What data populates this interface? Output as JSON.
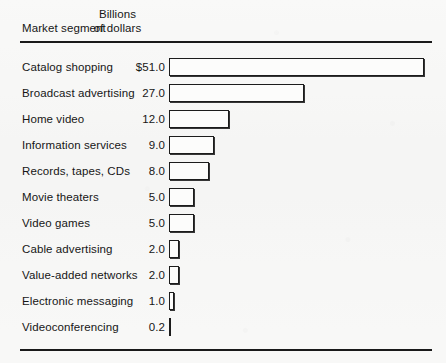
{
  "header": {
    "left_label": "Market segment",
    "right_label_line1": "Billions",
    "right_label_line2": "of dollars"
  },
  "chart_data": {
    "type": "bar",
    "orientation": "horizontal",
    "title": "",
    "xlabel": "Billions of dollars",
    "ylabel": "Market segment",
    "grid": false,
    "legend": null,
    "axis_origin": 0,
    "xlim": [
      0,
      51
    ],
    "categories": [
      "Catalog shopping",
      "Broadcast advertising",
      "Home video",
      "Information services",
      "Records, tapes, CDs",
      "Movie theaters",
      "Video games",
      "Cable advertising",
      "Value-added networks",
      "Electronic messaging",
      "Videoconferencing"
    ],
    "values": [
      51.0,
      27.0,
      12.0,
      9.0,
      8.0,
      5.0,
      5.0,
      2.0,
      2.0,
      1.0,
      0.2
    ],
    "value_labels": [
      "$51.0",
      "27.0",
      "12.0",
      "9.0",
      "8.0",
      "5.0",
      "5.0",
      "2.0",
      "2.0",
      "1.0",
      "0.2"
    ]
  },
  "style": {
    "bar_fill": "#fcfcfb",
    "bar_border": "#1c1c1c",
    "rule_color": "#1a1a1a",
    "background": "#f7f7f6",
    "text_color": "#161616",
    "pixels_per_unit": 5.0
  }
}
